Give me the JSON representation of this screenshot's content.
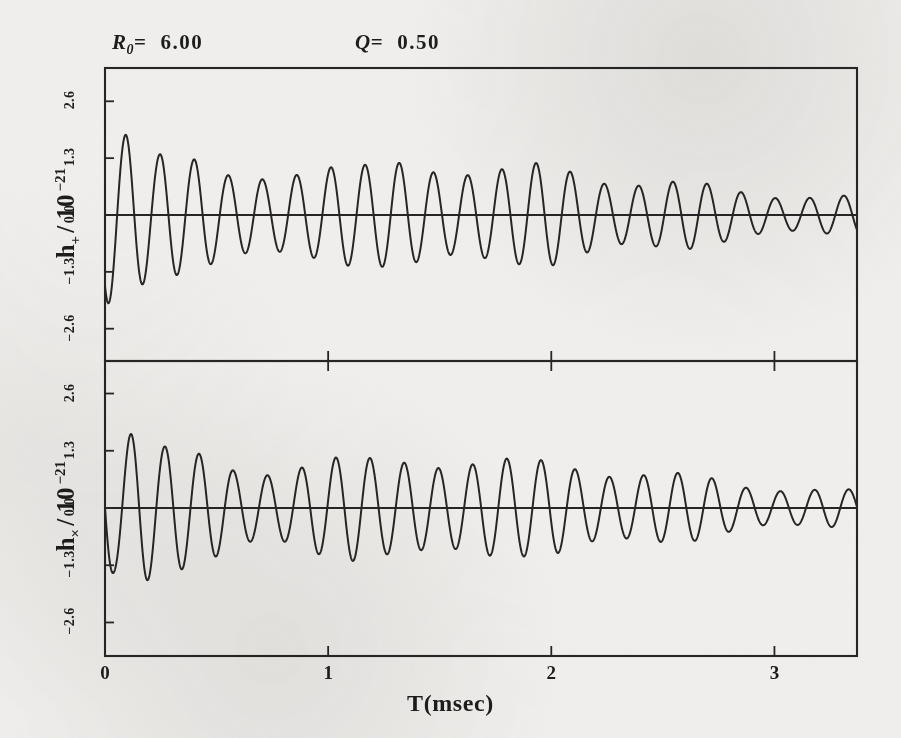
{
  "figure": {
    "background_color": "#efeeec",
    "ink_color": "#262626",
    "annotations": [
      {
        "id": "r0",
        "symbol": "R",
        "subscript": "0",
        "equals": "=",
        "value": "6.00"
      },
      {
        "id": "q",
        "symbol": "Q",
        "subscript": "",
        "equals": "=",
        "value": "0.50"
      }
    ]
  },
  "axes": {
    "x": {
      "label": "T(msec)",
      "ticks": [
        "0",
        "1",
        "2",
        "3"
      ],
      "tick_values": [
        0,
        1,
        2,
        3
      ],
      "range": [
        0,
        3.37
      ]
    },
    "y_top": {
      "label_main": "h",
      "label_sub": "+",
      "label_div": "/ 10",
      "label_exp": "−21",
      "ticks": [
        "2.6",
        "1.3",
        "0.0",
        "−1.3",
        "−2.6"
      ],
      "tick_values": [
        2.6,
        1.3,
        0.0,
        -1.3,
        -2.6
      ],
      "range": [
        -3.35,
        3.35
      ]
    },
    "y_bottom": {
      "label_main": "h",
      "label_sub": "×",
      "label_div": "/ 10",
      "label_exp": "−21",
      "ticks": [
        "2.6",
        "1.3",
        "0.0",
        "−1.3",
        "−2.6"
      ],
      "tick_values": [
        2.6,
        1.3,
        0.0,
        -1.3,
        -2.6
      ],
      "range": [
        -3.35,
        3.35
      ]
    }
  },
  "chart_data": {
    "type": "line",
    "title": "",
    "subtitle": "R0= 6.00    Q= 0.50",
    "xlabel": "T(msec)",
    "grid": false,
    "legend": "none",
    "panels": [
      {
        "name": "h-plus",
        "ylabel": "h_+ / 10^-21",
        "xlim": [
          0,
          3.37
        ],
        "ylim": [
          -3.35,
          3.35
        ],
        "yticks": [
          -2.6,
          -1.3,
          0.0,
          1.3,
          2.6
        ],
        "xticks": [
          0,
          1,
          2,
          3
        ],
        "description": "Damped amplitude-modulated gravitational waveform, plus polarization. Begins near -1.6 at T=0, rises to first large peak of about +2.6 near T=0.09 msec, then oscillates with a beat envelope that decays to about +/-0.45 by T=3.3 msec.",
        "model": {
          "form": "envelope_beat_sinusoid",
          "omega_rad_per_ms": 41.0,
          "phase0_rad": 4.05,
          "decay_rate_per_ms": 0.72,
          "amp0": 2.95,
          "amp_floor": 0.42,
          "beat_depth": 0.3,
          "beat_omega_rad_per_ms": 8.6,
          "beat_phase_rad": 1.15
        },
        "envelope_points": [
          {
            "t": 0.0,
            "a": 2.75
          },
          {
            "t": 0.09,
            "a": 2.62
          },
          {
            "t": 0.25,
            "a": 1.72
          },
          {
            "t": 0.4,
            "a": 1.3
          },
          {
            "t": 0.55,
            "a": 0.95
          },
          {
            "t": 0.7,
            "a": 1.05
          },
          {
            "t": 0.86,
            "a": 1.3
          },
          {
            "t": 1.02,
            "a": 1.28
          },
          {
            "t": 1.18,
            "a": 1.15
          },
          {
            "t": 1.34,
            "a": 1.3
          },
          {
            "t": 1.5,
            "a": 1.32
          },
          {
            "t": 1.66,
            "a": 1.25
          },
          {
            "t": 1.82,
            "a": 1.15
          },
          {
            "t": 1.98,
            "a": 1.2
          },
          {
            "t": 2.14,
            "a": 1.1
          },
          {
            "t": 2.3,
            "a": 0.95
          },
          {
            "t": 2.46,
            "a": 0.85
          },
          {
            "t": 2.62,
            "a": 0.78
          },
          {
            "t": 2.78,
            "a": 0.66
          },
          {
            "t": 2.94,
            "a": 0.58
          },
          {
            "t": 3.1,
            "a": 0.5
          },
          {
            "t": 3.37,
            "a": 0.45
          }
        ]
      },
      {
        "name": "h-cross",
        "ylabel": "h_x / 10^-21",
        "xlim": [
          0,
          3.37
        ],
        "ylim": [
          -3.35,
          3.35
        ],
        "yticks": [
          -2.6,
          -1.3,
          0.0,
          1.3,
          2.6
        ],
        "xticks": [
          0,
          1,
          2,
          3
        ],
        "description": "Damped amplitude-modulated gravitational waveform, cross polarization. Begins at 0 at T=0, dips to about -2.0, rises to first large peak of about +2.35 near T=0.13 msec, then oscillates with a beat envelope that decays to about +/-0.4 by T=3.3 msec. Phase shifted roughly a quarter cycle relative to h_plus.",
        "model": {
          "form": "envelope_beat_sinusoid",
          "omega_rad_per_ms": 41.0,
          "phase0_rad": 3.14,
          "decay_rate_per_ms": 0.74,
          "amp0": 2.7,
          "amp_floor": 0.4,
          "beat_depth": 0.3,
          "beat_omega_rad_per_ms": 8.6,
          "beat_phase_rad": 1.35
        },
        "envelope_points": [
          {
            "t": 0.0,
            "a": 2.4
          },
          {
            "t": 0.05,
            "a": 2.05
          },
          {
            "t": 0.13,
            "a": 2.35
          },
          {
            "t": 0.28,
            "a": 1.55
          },
          {
            "t": 0.44,
            "a": 1.22
          },
          {
            "t": 0.6,
            "a": 0.95
          },
          {
            "t": 0.76,
            "a": 1.05
          },
          {
            "t": 0.92,
            "a": 1.25
          },
          {
            "t": 1.08,
            "a": 1.22
          },
          {
            "t": 1.24,
            "a": 1.12
          },
          {
            "t": 1.4,
            "a": 1.28
          },
          {
            "t": 1.56,
            "a": 1.3
          },
          {
            "t": 1.72,
            "a": 1.22
          },
          {
            "t": 1.88,
            "a": 1.1
          },
          {
            "t": 2.04,
            "a": 1.15
          },
          {
            "t": 2.2,
            "a": 1.05
          },
          {
            "t": 2.36,
            "a": 0.92
          },
          {
            "t": 2.52,
            "a": 0.82
          },
          {
            "t": 2.68,
            "a": 0.74
          },
          {
            "t": 2.84,
            "a": 0.62
          },
          {
            "t": 3.0,
            "a": 0.54
          },
          {
            "t": 3.16,
            "a": 0.47
          },
          {
            "t": 3.37,
            "a": 0.42
          }
        ]
      }
    ]
  },
  "geometry": {
    "plot_left": 105,
    "plot_right": 857,
    "top_panel": {
      "top": 68,
      "bottom": 361,
      "zero_y": 215
    },
    "bottom_panel": {
      "top": 361,
      "bottom": 656,
      "zero_y": 508
    },
    "px_per_msec": 223.0,
    "px_per_unit": 44.2
  }
}
